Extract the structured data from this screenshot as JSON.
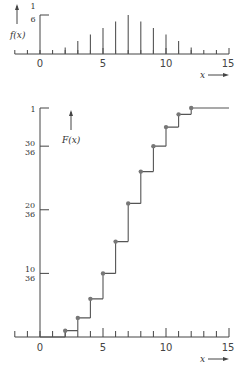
{
  "chart_data": [
    {
      "type": "bar",
      "title": "",
      "ylabel": "f(x)",
      "xlabel": "x",
      "categories": [
        2,
        3,
        4,
        5,
        6,
        7,
        8,
        9,
        10,
        11,
        12
      ],
      "values": [
        0.0278,
        0.0556,
        0.0833,
        0.1111,
        0.1389,
        0.1667,
        0.1389,
        0.1111,
        0.0833,
        0.0556,
        0.0278
      ],
      "values_fraction": [
        "1/36",
        "2/36",
        "3/36",
        "4/36",
        "5/36",
        "6/36",
        "5/36",
        "4/36",
        "3/36",
        "2/36",
        "1/36"
      ],
      "x_ticks": [
        -2,
        -1,
        0,
        1,
        2,
        3,
        4,
        5,
        6,
        7,
        8,
        9,
        10,
        11,
        12,
        13,
        14,
        15
      ],
      "x_tick_labels": [
        "0",
        "5",
        "10",
        "15"
      ],
      "y_tick_labels": [
        "1/6"
      ],
      "xlim": [
        -2,
        15
      ],
      "ylim": [
        0,
        0.1667
      ],
      "grid": false,
      "legend": null
    },
    {
      "type": "line",
      "subtype": "step-cdf",
      "title": "",
      "ylabel": "F(x)",
      "xlabel": "x",
      "x": [
        2,
        3,
        4,
        5,
        6,
        7,
        8,
        9,
        10,
        11,
        12
      ],
      "values": [
        0.0278,
        0.0833,
        0.1667,
        0.2778,
        0.4167,
        0.5833,
        0.7222,
        0.8333,
        0.9167,
        0.9722,
        1.0
      ],
      "values_fraction": [
        "1/36",
        "3/36",
        "6/36",
        "10/36",
        "15/36",
        "21/36",
        "26/36",
        "30/36",
        "33/36",
        "35/36",
        "36/36"
      ],
      "x_tick_labels": [
        "0",
        "5",
        "10",
        "15"
      ],
      "y_tick_labels": [
        "10/36",
        "20/36",
        "30/36",
        "1"
      ],
      "xlim": [
        -2,
        15
      ],
      "ylim": [
        0,
        1
      ],
      "grid": false,
      "legend": null
    }
  ],
  "top": {
    "ylabel": "f(x)",
    "xlabel": "x",
    "ytick": {
      "num": "1",
      "den": "6"
    },
    "xticks": [
      "0",
      "5",
      "10",
      "15"
    ]
  },
  "bottom": {
    "ylabel": "F(x)",
    "xlabel": "x",
    "yticks": [
      {
        "num": "10",
        "den": "36"
      },
      {
        "num": "20",
        "den": "36"
      },
      {
        "num": "30",
        "den": "36"
      }
    ],
    "ytop": "1",
    "xticks": [
      "0",
      "5",
      "10",
      "15"
    ]
  },
  "colors": {
    "axis": "#444444",
    "bar": "#555555",
    "dot": "#777777",
    "step": "#555555"
  }
}
